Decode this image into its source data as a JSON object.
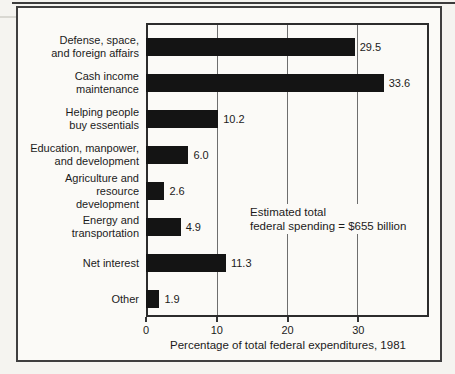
{
  "chart_data": {
    "type": "bar",
    "orientation": "horizontal",
    "title": "",
    "xlabel": "Percentage of total federal expenditures, 1981",
    "ylabel": "",
    "xlim": [
      0,
      40
    ],
    "x_ticks": [
      0,
      10,
      20,
      30
    ],
    "grid": true,
    "bar_color": "#141414",
    "categories": [
      "Defense, space, and foreign affairs",
      "Cash income maintenance",
      "Helping people buy essentials",
      "Education, manpower, and development",
      "Agriculture and resource development",
      "Energy and transportation",
      "Net interest",
      "Other"
    ],
    "values": [
      29.5,
      33.6,
      10.2,
      6.0,
      2.6,
      4.9,
      11.3,
      1.9
    ],
    "rows": [
      {
        "lines": [
          "Defense, space,",
          "and foreign affairs"
        ],
        "value": 29.5,
        "value_label": "29.5"
      },
      {
        "lines": [
          "Cash income",
          "maintenance"
        ],
        "value": 33.6,
        "value_label": "33.6"
      },
      {
        "lines": [
          "Helping people",
          "buy essentials"
        ],
        "value": 10.2,
        "value_label": "10.2"
      },
      {
        "lines": [
          "Education, manpower,",
          "and development"
        ],
        "value": 6.0,
        "value_label": "6.0"
      },
      {
        "lines": [
          "Agriculture and resource",
          "development"
        ],
        "value": 2.6,
        "value_label": "2.6"
      },
      {
        "lines": [
          "Energy and",
          "transportation"
        ],
        "value": 4.9,
        "value_label": "4.9"
      },
      {
        "lines": [
          "Net interest"
        ],
        "value": 11.3,
        "value_label": "11.3"
      },
      {
        "lines": [
          "Other"
        ],
        "value": 1.9,
        "value_label": "1.9"
      }
    ],
    "annotation": {
      "line1": "Estimated total",
      "line2": "federal spending = $655 billion"
    }
  }
}
